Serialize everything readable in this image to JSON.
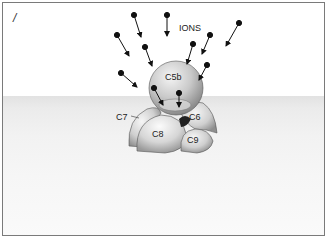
{
  "figure": {
    "panel_label": "/",
    "ions_label": "IONS",
    "components": [
      {
        "id": "c5b",
        "label": "C5b"
      },
      {
        "id": "c6",
        "label": "C6"
      },
      {
        "id": "c7",
        "label": "C7"
      },
      {
        "id": "c8",
        "label": "C8"
      },
      {
        "id": "c9",
        "label": "C9"
      }
    ],
    "colors": {
      "border": "#7a7a7a",
      "membrane": "#e6e6e6",
      "ion": "#111111"
    }
  }
}
